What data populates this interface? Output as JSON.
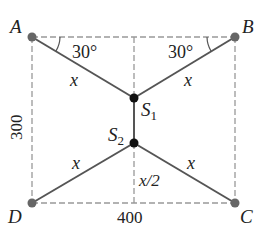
{
  "diagram": {
    "type": "physics-force-diagram",
    "points": {
      "A": {
        "label": "A",
        "x": 32,
        "y": 37
      },
      "B": {
        "label": "B",
        "x": 235,
        "y": 37
      },
      "C": {
        "label": "C",
        "x": 235,
        "y": 203
      },
      "D": {
        "label": "D",
        "x": 32,
        "y": 203
      },
      "S1": {
        "label": "S",
        "sub": "1",
        "x": 134,
        "y": 98
      },
      "S2": {
        "label": "S",
        "sub": "2",
        "x": 134,
        "y": 143
      }
    },
    "angle_labels": {
      "left": "30°",
      "right": "30°"
    },
    "segment_labels": {
      "AS1": "x",
      "BS1": "x",
      "DS2": "x",
      "CS2": "x",
      "S2_to_DC": "x/2"
    },
    "dimensions": {
      "height": "300",
      "width": "400"
    },
    "colors": {
      "solid_line": "#555555",
      "dashed_line": "#999999",
      "corner_dot": "#666666",
      "node_dot": "#111111",
      "text": "#222222"
    }
  }
}
